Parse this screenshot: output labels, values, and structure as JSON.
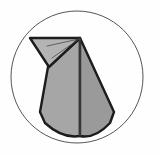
{
  "canvas": {
    "width": 160,
    "height": 156,
    "background_color": "#fefefe",
    "title": "Origami fold diagram"
  },
  "colors": {
    "background": "#fefefe",
    "circle_stroke": "#555555",
    "outline_stroke": "#1c1c1c",
    "paper_fill_light": "#b4b4b4",
    "paper_fill_mid": "#a6a6a6",
    "paper_fill_dark": "#9a9a9a",
    "crease_stroke": "#4a4a4a"
  },
  "circle": {
    "label": "enclosing-circle",
    "center_x": 77,
    "center_y": 77,
    "radius": 66,
    "stroke_width": 1,
    "fill": "none"
  },
  "figure": {
    "label": "origami-folded-paper",
    "apex": {
      "x": 80,
      "y": 38
    },
    "parts": [
      {
        "name": "left-flap",
        "description": "Upper-left triangular flap pointing left from the apex",
        "points": "30,38 80,38 49,67",
        "fill": "#b4b4b4"
      },
      {
        "name": "body-left-panel",
        "description": "Left half of the tall cone body",
        "points": "80,38 80,136 45,123 40,112 48,67",
        "fill": "#a6a6a6"
      },
      {
        "name": "body-right-panel",
        "description": "Right half of the tall cone body",
        "points": "80,38 114,112 110,123 80,136",
        "fill": "#9a9a9a"
      }
    ],
    "creases": [
      {
        "name": "crease-upper",
        "x1": 47,
        "y1": 46,
        "x2": 79,
        "y2": 39
      },
      {
        "name": "crease-lower",
        "x1": 52,
        "y1": 58,
        "x2": 79,
        "y2": 39
      },
      {
        "name": "crease-center-spine",
        "x1": 80,
        "y1": 38,
        "x2": 80,
        "y2": 136
      }
    ]
  }
}
